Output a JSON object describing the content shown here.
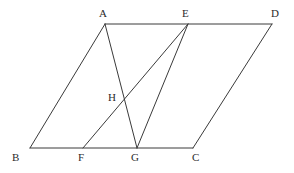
{
  "figure": {
    "background_color": "#ffffff",
    "line_color": "#3a3a3a",
    "label_color": "#2b2b2b",
    "width": 294,
    "height": 173,
    "points": [
      {
        "name": "A",
        "label": "A",
        "x": 105,
        "y": 24,
        "label_x": 99,
        "label_y": 8
      },
      {
        "name": "E",
        "label": "E",
        "x": 188,
        "y": 24,
        "label_x": 182,
        "label_y": 8
      },
      {
        "name": "D",
        "label": "D",
        "x": 272,
        "y": 24,
        "label_x": 271,
        "label_y": 8
      },
      {
        "name": "H",
        "label": "H",
        "x": 125,
        "y": 99,
        "label_x": 108,
        "label_y": 92
      },
      {
        "name": "B",
        "label": "B",
        "x": 30,
        "y": 148,
        "label_x": 12,
        "label_y": 152
      },
      {
        "name": "F",
        "label": "F",
        "x": 83,
        "y": 148,
        "label_x": 78,
        "label_y": 152
      },
      {
        "name": "G",
        "label": "G",
        "x": 137,
        "y": 148,
        "label_x": 131,
        "label_y": 152
      },
      {
        "name": "C",
        "label": "C",
        "x": 193,
        "y": 148,
        "label_x": 192,
        "label_y": 152
      }
    ],
    "segments": [
      {
        "name": "segment-A-D",
        "from": "A",
        "to": "D",
        "path": "M 105 24 L 272 24"
      },
      {
        "name": "segment-B-C",
        "from": "B",
        "to": "C",
        "path": "M 30 148 L 193 148"
      },
      {
        "name": "segment-A-B",
        "from": "A",
        "to": "B",
        "path": "M 105 24 L 30 148"
      },
      {
        "name": "segment-D-C",
        "from": "D",
        "to": "C",
        "path": "M 272 24 L 193 148"
      },
      {
        "name": "segment-A-G",
        "from": "A",
        "to": "G",
        "path": "M 105 24 L 137 148"
      },
      {
        "name": "segment-E-F",
        "from": "E",
        "to": "F",
        "path": "M 188 24 L 83 148"
      },
      {
        "name": "segment-E-G",
        "from": "E",
        "to": "G",
        "path": "M 188 24 L 137 148"
      }
    ]
  }
}
